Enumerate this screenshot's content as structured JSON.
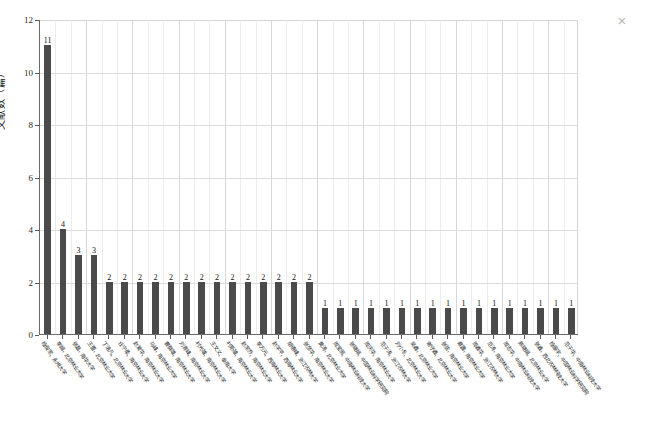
{
  "window": {
    "close_label": "×",
    "close_icon": "close-icon"
  },
  "chart_data": {
    "type": "bar",
    "title": "",
    "xlabel": "",
    "ylabel": "文献数（篇）",
    "ylim": [
      0,
      12
    ],
    "ytick_values": [
      0,
      2,
      4,
      6,
      8,
      10,
      12
    ],
    "ytick_labels": [
      "0",
      "2",
      "4",
      "6",
      "8",
      "10",
      "12"
    ],
    "grid": true,
    "legend": "none",
    "bar_color": "#4a4a4a",
    "show_value_labels": true,
    "categories": [
      "杨俊家，永州大学",
      "李娟，北京林业大学",
      "张磊，南华大学",
      "王蕾，北京林业大学",
      "丁浩凡，北京林业大学",
      "任宁柔，南京林业大学",
      "赵爱华，南京林业大学",
      "马峰，南京林业大学",
      "曹群雄，南京林业大学",
      "刘青峰，南京林业大学",
      "村光雄，南京林业大学",
      "王文义，泰南大学",
      "村斯雄，南京林业大学",
      "赵家乔，南京林业大学",
      "李万元，西南林业大学",
      "赵学平，西南林业大学",
      "胡德峰，浙江农林大学",
      "张彦华，南京林业大学",
      "黄涛，北京林业大学",
      "周宝丽，中南林业科技大学",
      "张晓娟，中国林业科学研究院",
      "周庆华，南京林业大学",
      "范子涛，浙江农林大学",
      "刘小冬，北京林业大学",
      "吴鑫，北京林业大学",
      "谢守鑫，北京林业大学",
      "张弦，南京林业大学",
      "蔡震，南京林业大学",
      "周鑫华，浙江农林大学",
      "范涛，南京林业大学",
      "周志华，中南林业科技大学",
      "陈晓娟，北京林业大学",
      "张鑫，西北农林科技大学",
      "杨振宇，中国林业科学研究院",
      "范子华，中南林业科技大学"
    ],
    "values": [
      11,
      4,
      3,
      3,
      2,
      2,
      2,
      2,
      2,
      2,
      2,
      2,
      2,
      2,
      2,
      2,
      2,
      2,
      1,
      1,
      1,
      1,
      1,
      1,
      1,
      1,
      1,
      1,
      1,
      1,
      1,
      1,
      1,
      1,
      1
    ]
  }
}
